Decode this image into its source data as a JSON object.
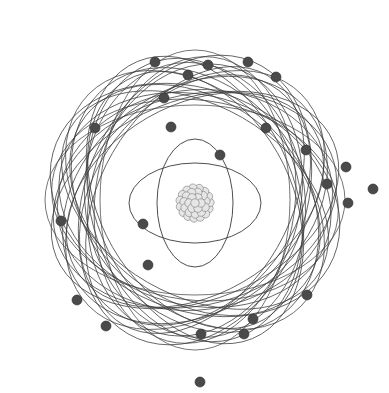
{
  "diagram": {
    "center": [
      195,
      200
    ],
    "colors": {
      "background": "#ffffff",
      "orbit_stroke": "#3a3a3a",
      "electron_fill": "#4a4a4a",
      "nucleon_fill": "#e6e6e6",
      "nucleon_stroke": "#7a7a7a"
    },
    "nucleus": {
      "cx": 195,
      "cy": 203,
      "r": 17,
      "label": "nucleus"
    },
    "inner_orbits": [
      {
        "rx": 66,
        "ry": 40,
        "rotation": 0
      },
      {
        "rx": 38,
        "ry": 64,
        "rotation": 0
      }
    ],
    "outer_orbit_family": {
      "count": 24,
      "rx": 150,
      "ry": 95,
      "cx": 195,
      "cy": 200
    },
    "electrons": [
      [
        155,
        62
      ],
      [
        208,
        65
      ],
      [
        248,
        62
      ],
      [
        276,
        77
      ],
      [
        188,
        75
      ],
      [
        164,
        98
      ],
      [
        95,
        128
      ],
      [
        171,
        127
      ],
      [
        266,
        128
      ],
      [
        306,
        150
      ],
      [
        346,
        167
      ],
      [
        220,
        155
      ],
      [
        327,
        184
      ],
      [
        373,
        189
      ],
      [
        348,
        203
      ],
      [
        61,
        221
      ],
      [
        143,
        224
      ],
      [
        148,
        265
      ],
      [
        307,
        295
      ],
      [
        77,
        300
      ],
      [
        253,
        319
      ],
      [
        106,
        326
      ],
      [
        244,
        334
      ],
      [
        201,
        334
      ],
      [
        200,
        382
      ]
    ]
  }
}
